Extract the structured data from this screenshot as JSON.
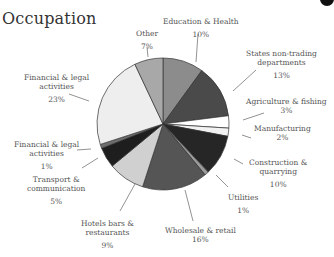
{
  "chart_data": {
    "type": "pie",
    "title": "Occupation",
    "categories": [
      "Education & Health",
      "States non-trading departments",
      "Agriculture & fishing",
      "Manufacturing",
      "Construction & quarrying",
      "Utilities",
      "Wholesale & retail",
      "Hotels bars & restaurants",
      "Transport & communication",
      "Financial & legal activities (1%)",
      "Financial & legal activities (23%)",
      "Other"
    ],
    "values": [
      10,
      13,
      3,
      2,
      10,
      1,
      16,
      9,
      5,
      1,
      23,
      7
    ],
    "unit": "%",
    "colors": [
      "#8c8c8c",
      "#4a4a4a",
      "#ffffff",
      "#f2f2f2",
      "#262626",
      "#9a9a9a",
      "#555555",
      "#d0d0d0",
      "#1e1e1e",
      "#6e6e6e",
      "#eeeeee",
      "#a8a8a8"
    ],
    "legend": "none (direct labels with leader lines)"
  },
  "labels": {
    "title": "Occupation",
    "education": {
      "name": "Education & Health",
      "pct": "10%"
    },
    "states": {
      "name1": "States non-trading",
      "name2": "departments",
      "pct": "13%"
    },
    "agri": {
      "name": "Agriculture & fishing",
      "pct": "3%"
    },
    "manuf": {
      "name": "Manufacturing",
      "pct": "2%"
    },
    "constr": {
      "name1": "Construction &",
      "name2": "quarrying",
      "pct": "10%"
    },
    "util": {
      "name": "Utilities",
      "pct": "1%"
    },
    "wholesale": {
      "name": "Wholesale & retail",
      "pct": "16%"
    },
    "hotels": {
      "name1": "Hotels bars &",
      "name2": "restaurants",
      "pct": "9%"
    },
    "transport": {
      "name1": "Transport &",
      "name2": "communication",
      "pct": "5%"
    },
    "fin1": {
      "name1": "Financial & legal",
      "name2": "activities",
      "pct": "1%"
    },
    "fin23": {
      "name1": "Financial & legal",
      "name2": "activities",
      "pct": "23%"
    },
    "other": {
      "name": "Other",
      "pct": "7%"
    }
  }
}
